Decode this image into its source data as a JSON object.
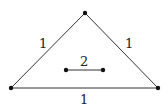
{
  "diagram": {
    "type": "graph",
    "nodes": [
      {
        "id": "top",
        "x": 85,
        "y": 13
      },
      {
        "id": "bottom-left",
        "x": 11,
        "y": 88
      },
      {
        "id": "bottom-right",
        "x": 158,
        "y": 88
      },
      {
        "id": "inner-left",
        "x": 66,
        "y": 70
      },
      {
        "id": "inner-right",
        "x": 103,
        "y": 70
      }
    ],
    "edges": [
      {
        "from": "top",
        "to": "bottom-left",
        "label": "1"
      },
      {
        "from": "top",
        "to": "bottom-right",
        "label": "1"
      },
      {
        "from": "bottom-left",
        "to": "bottom-right",
        "label": "1"
      },
      {
        "from": "inner-left",
        "to": "inner-right",
        "label": "2"
      }
    ]
  }
}
